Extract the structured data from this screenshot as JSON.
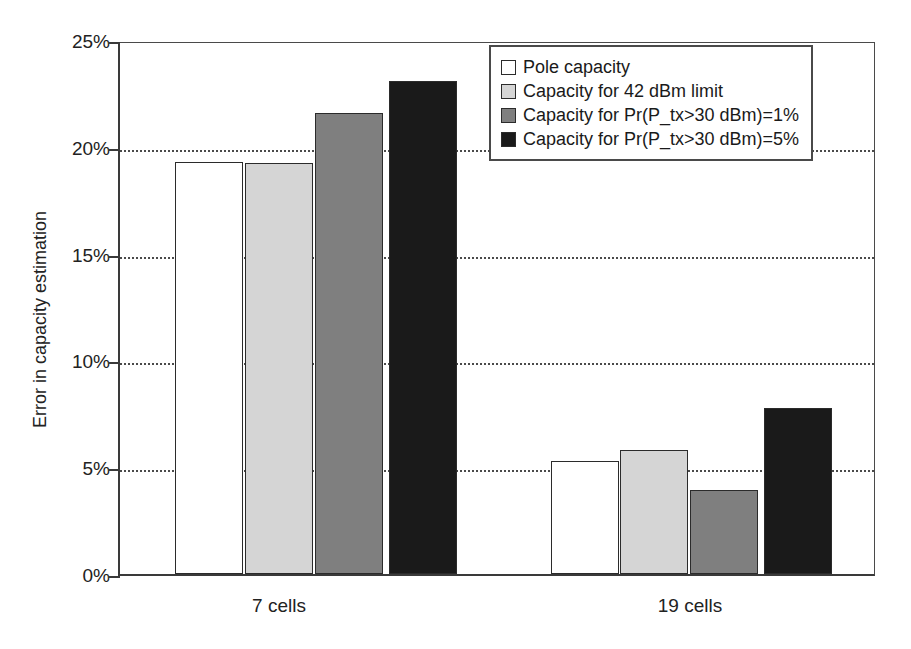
{
  "chart_data": {
    "type": "bar",
    "title": "",
    "xlabel": "",
    "ylabel": "Error in capacity estimation",
    "categories": [
      "7 cells",
      "19 cells"
    ],
    "ylim": [
      0,
      25
    ],
    "ytick_labels": [
      "0%",
      "5%",
      "10%",
      "15%",
      "20%",
      "25%"
    ],
    "ytick_values": [
      0,
      5,
      10,
      15,
      20,
      25
    ],
    "grid": true,
    "legend_position": "top-right",
    "value_unit": "%",
    "series": [
      {
        "name": "Pole capacity",
        "color": "#ffffff",
        "values": [
          19.3,
          5.3
        ]
      },
      {
        "name": "Capacity for 42 dBm limit",
        "color": "#d5d5d5",
        "values": [
          19.25,
          5.8
        ]
      },
      {
        "name": "Capacity for Pr(P_tx>30 dBm)=1%",
        "color": "#7f7f7f",
        "values": [
          21.6,
          3.95
        ]
      },
      {
        "name": "Capacity for Pr(P_tx>30 dBm)=5%",
        "color": "#1a1a1a",
        "values": [
          23.1,
          7.75
        ]
      }
    ]
  },
  "legend": {
    "items": [
      {
        "label": "Pole capacity",
        "color": "#ffffff"
      },
      {
        "label": "Capacity for 42 dBm limit",
        "color": "#d5d5d5"
      },
      {
        "label": "Capacity for Pr(P_tx>30 dBm)=1%",
        "color": "#7f7f7f"
      },
      {
        "label": "Capacity for Pr(P_tx>30 dBm)=5%",
        "color": "#1a1a1a"
      }
    ]
  },
  "axes": {
    "y_title": "Error in capacity estimation",
    "y_ticks": [
      "25%",
      "20%",
      "15%",
      "10%",
      "5%",
      "0%"
    ],
    "x_ticks": [
      "7 cells",
      "19 cells"
    ]
  }
}
